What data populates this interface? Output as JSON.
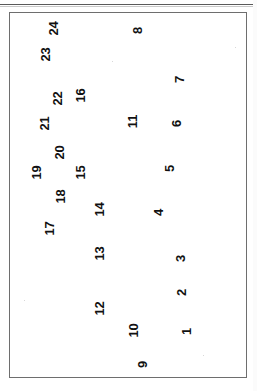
{
  "figure": {
    "kind": "scanned-numbered-point-figure",
    "orientation": "labels-rotated-90-ccw",
    "frame": {
      "border_color": "#6e6e6e",
      "background_color": "#ffffff",
      "left": 9,
      "top": 12,
      "width": 238,
      "height": 366
    },
    "top_rule": {
      "color": "#5a5a5a",
      "top": 4
    },
    "label_color": "#111111"
  },
  "chart_data": {
    "type": "scatter",
    "title": "",
    "subtitle": "",
    "xlabel": "",
    "ylabel": "",
    "grid": false,
    "legend": null,
    "axis_visible": false,
    "note": "Numbered point labels only; no axes, ticks or data markers are drawn. Positions are pixel coordinates within the 257x391 scan, with labels rotated 90 degrees counter-clockwise.",
    "xlim": [
      9,
      247
    ],
    "ylim": [
      12,
      378
    ],
    "points": [
      {
        "label": "1",
        "x": 186,
        "y": 331
      },
      {
        "label": "2",
        "x": 181,
        "y": 292
      },
      {
        "label": "3",
        "x": 180,
        "y": 258
      },
      {
        "label": "4",
        "x": 158,
        "y": 212
      },
      {
        "label": "5",
        "x": 169,
        "y": 168
      },
      {
        "label": "6",
        "x": 176,
        "y": 123
      },
      {
        "label": "7",
        "x": 179,
        "y": 79
      },
      {
        "label": "8",
        "x": 137,
        "y": 30
      },
      {
        "label": "9",
        "x": 142,
        "y": 364
      },
      {
        "label": "10",
        "x": 133,
        "y": 330
      },
      {
        "label": "11",
        "x": 132,
        "y": 121
      },
      {
        "label": "12",
        "x": 99,
        "y": 308
      },
      {
        "label": "13",
        "x": 99,
        "y": 253
      },
      {
        "label": "14",
        "x": 99,
        "y": 209
      },
      {
        "label": "15",
        "x": 80,
        "y": 172
      },
      {
        "label": "16",
        "x": 80,
        "y": 95
      },
      {
        "label": "17",
        "x": 49,
        "y": 228
      },
      {
        "label": "18",
        "x": 60,
        "y": 196
      },
      {
        "label": "19",
        "x": 36,
        "y": 172
      },
      {
        "label": "20",
        "x": 59,
        "y": 152
      },
      {
        "label": "21",
        "x": 44,
        "y": 123
      },
      {
        "label": "22",
        "x": 57,
        "y": 98
      },
      {
        "label": "23",
        "x": 45,
        "y": 54
      },
      {
        "label": "24",
        "x": 53,
        "y": 28
      }
    ],
    "values": [
      1,
      2,
      3,
      4,
      5,
      6,
      7,
      8,
      9,
      10,
      11,
      12,
      13,
      14,
      15,
      16,
      17,
      18,
      19,
      20,
      21,
      22,
      23,
      24
    ],
    "categories": [
      "1",
      "2",
      "3",
      "4",
      "5",
      "6",
      "7",
      "8",
      "9",
      "10",
      "11",
      "12",
      "13",
      "14",
      "15",
      "16",
      "17",
      "18",
      "19",
      "20",
      "21",
      "22",
      "23",
      "24"
    ]
  },
  "speckles": [
    {
      "x": 112,
      "y": 61
    },
    {
      "x": 235,
      "y": 47
    },
    {
      "x": 24,
      "y": 300
    },
    {
      "x": 203,
      "y": 355
    }
  ]
}
